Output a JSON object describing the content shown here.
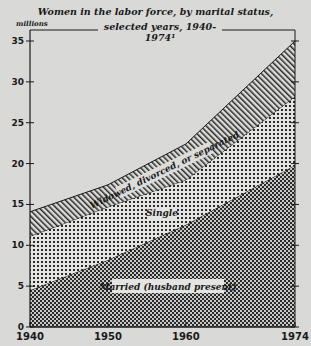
{
  "chart_data": {
    "type": "area",
    "stacked": true,
    "title_line1": "Women in the labor force, by marital status,",
    "title_line2": "selected years, 1940-1974¹",
    "ylabel": "millions",
    "xlabel": "",
    "x": [
      1940,
      1950,
      1960,
      1974
    ],
    "x_tick_labels": [
      "1940",
      "1950",
      "1960",
      "1974"
    ],
    "y_ticks": [
      0,
      5,
      10,
      15,
      20,
      25,
      30,
      35
    ],
    "ylim": [
      0,
      35
    ],
    "grid": false,
    "legend": "inline labels",
    "series": [
      {
        "name": "Married (husband present)",
        "pattern": "dense crosshatch",
        "values": [
          4.5,
          8.2,
          12.5,
          19.8
        ]
      },
      {
        "name": "Single",
        "pattern": "open crosshatch",
        "values": [
          6.6,
          6.5,
          5.5,
          8.4
        ]
      },
      {
        "name": "Widowed, divorced, or separated",
        "pattern": "diagonal hatch",
        "values": [
          3.0,
          2.7,
          4.4,
          6.8
        ]
      }
    ],
    "cumulative_tops": {
      "Married (husband present)": [
        4.5,
        8.2,
        12.5,
        19.8
      ],
      "Single": [
        11.1,
        14.7,
        18.0,
        28.2
      ],
      "Widowed, divorced, or separated": [
        14.1,
        17.4,
        22.4,
        35.0
      ]
    }
  },
  "labels": {
    "married": "Married (husband present)",
    "single": "Single",
    "widowed": "Widowed, divorced, or separated"
  }
}
